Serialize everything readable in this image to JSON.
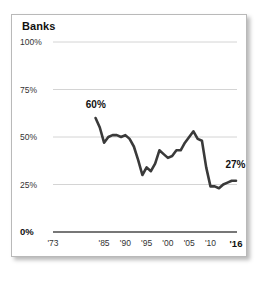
{
  "chart_data": {
    "type": "line",
    "title": "Banks",
    "xlabel": "",
    "ylabel": "",
    "ylim": [
      0,
      100
    ],
    "xlim": [
      1973,
      2016
    ],
    "grid": true,
    "legend": false,
    "y_ticks": [
      "0%",
      "25%",
      "50%",
      "75%",
      "100%"
    ],
    "y_tick_values": [
      0,
      25,
      50,
      75,
      100
    ],
    "x_ticks": [
      "'73",
      "'85",
      "'90",
      "'95",
      "'00",
      "'05",
      "'10",
      "'16"
    ],
    "x_tick_values": [
      1973,
      1985,
      1990,
      1995,
      2000,
      2005,
      2010,
      2016
    ],
    "annotations": [
      {
        "text": "60%",
        "x": 1984,
        "y": 60
      },
      {
        "text": "27%",
        "x": 2014,
        "y": 27
      }
    ],
    "series": [
      {
        "name": "Banks",
        "color": "#3a3a3a",
        "x": [
          1983,
          1984,
          1985,
          1986,
          1987,
          1988,
          1989,
          1990,
          1991,
          1992,
          1993,
          1994,
          1995,
          1996,
          1997,
          1998,
          1999,
          2000,
          2001,
          2002,
          2003,
          2004,
          2005,
          2006,
          2007,
          2008,
          2009,
          2010,
          2011,
          2012,
          2013,
          2014,
          2015,
          2016
        ],
        "values": [
          60,
          55,
          47,
          50,
          51,
          51,
          50,
          51,
          49,
          45,
          38,
          30,
          34,
          32,
          36,
          43,
          41,
          39,
          40,
          43,
          43,
          47,
          50,
          53,
          49,
          48,
          34,
          24,
          24,
          23,
          25,
          26,
          27,
          27
        ]
      }
    ]
  }
}
